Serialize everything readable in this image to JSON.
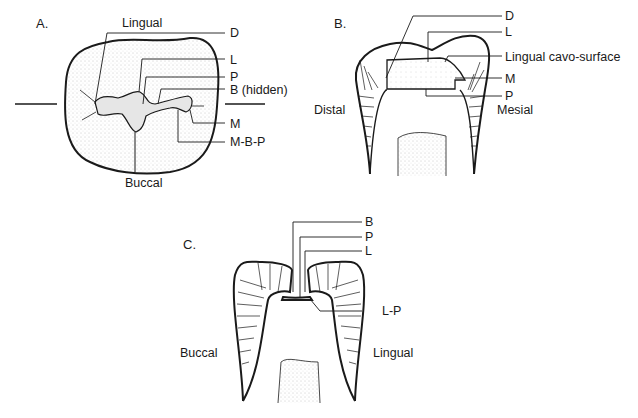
{
  "figure": {
    "panels": [
      {
        "id": "A",
        "label": "A.",
        "view": "occlusal",
        "orientation": {
          "top": "Lingual",
          "bottom": "Buccal"
        },
        "callouts": [
          "D",
          "L",
          "P",
          "B (hidden)",
          "M",
          "M-B-P"
        ]
      },
      {
        "id": "B",
        "label": "B.",
        "view": "mesiodistal section",
        "orientation": {
          "left": "Distal",
          "right": "Mesial"
        },
        "callouts": [
          "D",
          "L",
          "Lingual cavo-surface",
          "M",
          "P"
        ]
      },
      {
        "id": "C",
        "label": "C.",
        "view": "buccolingual section",
        "orientation": {
          "left": "Buccal",
          "right": "Lingual"
        },
        "callouts": [
          "B",
          "P",
          "L",
          "L-P"
        ]
      }
    ]
  },
  "colors": {
    "ink": "#1a1a1a",
    "stipple": "#9a9a9a",
    "background": "#ffffff"
  }
}
